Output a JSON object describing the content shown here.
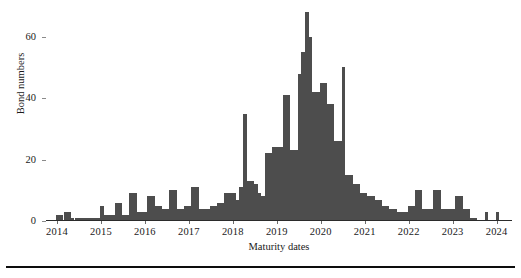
{
  "chart_data": {
    "type": "bar",
    "title": "",
    "subtitle": "",
    "xlabel": "Maturity dates",
    "ylabel": "Bond numbers",
    "xlim": [
      2013.75,
      2024.35
    ],
    "ylim": [
      0,
      70
    ],
    "grid": false,
    "legend": null,
    "bar_color": "#4d4d4d",
    "bin_width_years": 0.0833,
    "x_tick_labels": [
      "2014",
      "2015",
      "2016",
      "2017",
      "2018",
      "2019",
      "2020",
      "2021",
      "2022",
      "2023",
      "2024"
    ],
    "x_tick_values": [
      2014,
      2015,
      2016,
      2017,
      2018,
      2019,
      2020,
      2021,
      2022,
      2023,
      2024
    ],
    "y_tick_labels": [
      "0",
      "20",
      "40",
      "60"
    ],
    "y_tick_values": [
      0,
      20,
      40,
      60
    ],
    "annotations": [],
    "x": [
      2014.02,
      2014.1,
      2014.19,
      2014.27,
      2014.35,
      2014.44,
      2014.52,
      2014.6,
      2014.69,
      2014.77,
      2014.85,
      2014.94,
      2015.02,
      2015.1,
      2015.19,
      2015.27,
      2015.35,
      2015.44,
      2015.52,
      2015.6,
      2015.69,
      2015.77,
      2015.85,
      2015.94,
      2016.02,
      2016.1,
      2016.19,
      2016.27,
      2016.35,
      2016.44,
      2016.52,
      2016.6,
      2016.69,
      2016.77,
      2016.85,
      2016.94,
      2017.02,
      2017.1,
      2017.19,
      2017.27,
      2017.35,
      2017.44,
      2017.52,
      2017.6,
      2017.69,
      2017.77,
      2017.85,
      2017.94,
      2018.02,
      2018.1,
      2018.19,
      2018.27,
      2018.35,
      2018.44,
      2018.52,
      2018.6,
      2018.69,
      2018.77,
      2018.85,
      2018.94,
      2019.02,
      2019.1,
      2019.19,
      2019.27,
      2019.35,
      2019.44,
      2019.52,
      2019.6,
      2019.69,
      2019.77,
      2019.85,
      2019.94,
      2020.02,
      2020.1,
      2020.19,
      2020.27,
      2020.35,
      2020.44,
      2020.52,
      2020.6,
      2020.69,
      2020.77,
      2020.85,
      2020.94,
      2021.02,
      2021.1,
      2021.19,
      2021.27,
      2021.35,
      2021.44,
      2021.52,
      2021.6,
      2021.69,
      2021.77,
      2021.85,
      2021.94,
      2022.02,
      2022.1,
      2022.19,
      2022.27,
      2022.35,
      2022.44,
      2022.52,
      2022.6,
      2022.69,
      2022.77,
      2022.85,
      2022.94,
      2023.02,
      2023.1,
      2023.19,
      2023.27,
      2023.35,
      2023.44,
      2023.52,
      2023.6,
      2023.69,
      2023.77,
      2023.85,
      2023.94,
      2024.02
    ],
    "values": [
      2,
      2,
      3,
      3,
      1,
      1,
      1,
      1,
      1,
      1,
      1,
      1,
      5,
      2,
      2,
      2,
      6,
      6,
      2,
      2,
      9,
      9,
      3,
      3,
      3,
      8,
      8,
      5,
      5,
      4,
      4,
      10,
      10,
      4,
      4,
      5,
      5,
      11,
      11,
      4,
      4,
      4,
      5,
      5,
      6,
      6,
      9,
      9,
      9,
      7,
      11,
      35,
      13,
      13,
      12,
      9,
      8,
      22,
      22,
      24,
      24,
      24,
      41,
      41,
      23,
      23,
      48,
      55,
      68,
      60,
      42,
      42,
      45,
      45,
      38,
      38,
      26,
      26,
      50,
      15,
      15,
      12,
      12,
      9,
      9,
      8,
      8,
      7,
      7,
      5,
      5,
      4,
      4,
      3,
      3,
      3,
      5,
      5,
      10,
      10,
      4,
      4,
      4,
      10,
      10,
      4,
      4,
      4,
      4,
      8,
      8,
      4,
      4,
      1,
      1,
      0,
      0,
      3,
      0,
      0,
      3
    ]
  },
  "axes": {
    "y_title": "Bond numbers",
    "x_title": "Maturity dates"
  }
}
